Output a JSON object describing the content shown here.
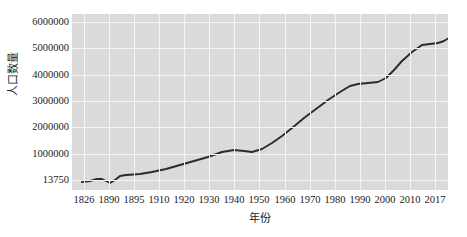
{
  "chart_data": {
    "type": "line",
    "title": "",
    "subtitle": "",
    "xlabel": "年份",
    "ylabel": "人口数量",
    "grid": true,
    "legend": false,
    "legend_position": "none",
    "line_color": "#2b2b2b",
    "plot_bg_color": "#dadada",
    "grid_color": "#f4f4f4",
    "text_color": "#1a1a1a",
    "xtick_labels": [
      "1826",
      "1890",
      "1895",
      "1910",
      "1920",
      "1930",
      "1940",
      "1950",
      "1960",
      "1970",
      "1980",
      "1990",
      "2000",
      "2010",
      "2017"
    ],
    "ytick_labels": [
      "6000000",
      "5000000",
      "4000000",
      "3000000",
      "2000000",
      "1000000",
      "13750"
    ],
    "ytick_values": [
      6000000,
      5000000,
      4000000,
      3000000,
      2000000,
      1000000,
      13750
    ],
    "ylim": [
      13750,
      6000000
    ],
    "categories": [
      "1826",
      "1890",
      "1895",
      "1910",
      "1920",
      "1930",
      "1940",
      "1950",
      "1960",
      "1970",
      "1980",
      "1990",
      "2000",
      "2010",
      "2017"
    ],
    "series": [
      {
        "name": "人口数量",
        "values": [
          60000,
          130000,
          180000,
          300000,
          430000,
          680000,
          800000,
          1080000,
          1600000,
          2150000,
          2420000,
          3100000,
          4150000,
          5200000,
          5680000
        ]
      }
    ],
    "points": [
      {
        "x": "1826",
        "y": 60000
      },
      {
        "x": "1890",
        "y": 130000
      },
      {
        "x": "1895",
        "y": 180000
      },
      {
        "x": "1910",
        "y": 300000
      },
      {
        "x": "1920",
        "y": 430000
      },
      {
        "x": "1930",
        "y": 680000
      },
      {
        "x": "1940",
        "y": 800000
      },
      {
        "x": "1950",
        "y": 1080000
      },
      {
        "x": "1960",
        "y": 1600000
      },
      {
        "x": "1970",
        "y": 2150000
      },
      {
        "x": "1980",
        "y": 2420000
      },
      {
        "x": "1990",
        "y": 3100000
      },
      {
        "x": "2000",
        "y": 4150000
      },
      {
        "x": "2010",
        "y": 5200000
      },
      {
        "x": "2017",
        "y": 5680000
      }
    ],
    "dense_pixel_path": [
      {
        "px": 0,
        "py": 168
      },
      {
        "px": 8,
        "py": 167
      },
      {
        "px": 15,
        "py": 165
      },
      {
        "px": 20,
        "py": 165
      },
      {
        "px": 24,
        "py": 167
      },
      {
        "px": 28,
        "py": 169
      },
      {
        "px": 33,
        "py": 166
      },
      {
        "px": 38,
        "py": 162
      },
      {
        "px": 44,
        "py": 161
      },
      {
        "px": 58,
        "py": 160
      },
      {
        "px": 70,
        "py": 158
      },
      {
        "px": 84,
        "py": 155
      },
      {
        "px": 98,
        "py": 151
      },
      {
        "px": 112,
        "py": 147
      },
      {
        "px": 126,
        "py": 143
      },
      {
        "px": 140,
        "py": 138
      },
      {
        "px": 152,
        "py": 136
      },
      {
        "px": 162,
        "py": 137
      },
      {
        "px": 170,
        "py": 138
      },
      {
        "px": 180,
        "py": 135
      },
      {
        "px": 190,
        "py": 129
      },
      {
        "px": 200,
        "py": 122
      },
      {
        "px": 210,
        "py": 114
      },
      {
        "px": 222,
        "py": 104
      },
      {
        "px": 234,
        "py": 95
      },
      {
        "px": 246,
        "py": 86
      },
      {
        "px": 258,
        "py": 78
      },
      {
        "px": 268,
        "py": 72
      },
      {
        "px": 276,
        "py": 70
      },
      {
        "px": 286,
        "py": 69
      },
      {
        "px": 296,
        "py": 68
      },
      {
        "px": 304,
        "py": 64
      },
      {
        "px": 312,
        "py": 56
      },
      {
        "px": 320,
        "py": 47
      },
      {
        "px": 330,
        "py": 38
      },
      {
        "px": 340,
        "py": 31
      },
      {
        "px": 348,
        "py": 30
      },
      {
        "px": 356,
        "py": 29
      },
      {
        "px": 362,
        "py": 27
      },
      {
        "px": 370,
        "py": 22
      },
      {
        "px": 378,
        "py": 17
      },
      {
        "px": 376,
        "py": 17
      }
    ]
  }
}
